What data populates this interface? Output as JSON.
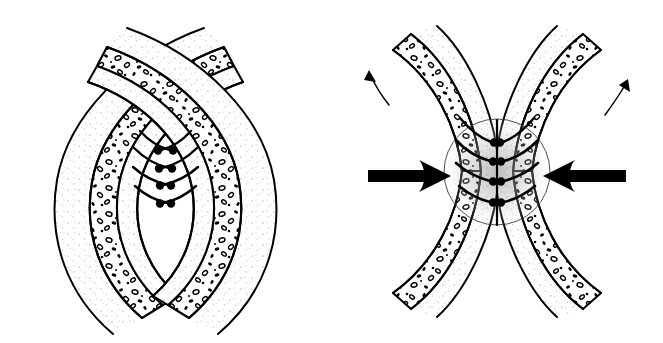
{
  "figure": {
    "background_color": "#ffffff",
    "ink_color": "#000000",
    "width": 663,
    "height": 343,
    "panel_count": 2
  },
  "panels": [
    {
      "id": "A",
      "label": "A",
      "state_description": "unloaded resting configuration, symmetric C-shaped arcs separated by a narrow vertical cleft",
      "label_position": {
        "x": 22,
        "y": 18
      },
      "center_x": 165,
      "center_y": 172,
      "has_compression_arrows": false,
      "has_flow_arrows": false,
      "has_stress_zone": false,
      "layers": [
        {
          "name": "outer-capsule-line",
          "fill": "none",
          "stroke": "#000000",
          "stroke_width": 2.0
        },
        {
          "name": "stippled-matrix-band",
          "fill": "#fbfbfb",
          "stipple": "light",
          "stroke": "#000000",
          "stroke_width": 2.0
        },
        {
          "name": "cellular-band",
          "fill": "#ffffff",
          "stipple": "dense-cells",
          "stroke": "#000000",
          "stroke_width": 2.2
        }
      ],
      "tadpole_structures": {
        "count_per_side": 4,
        "sides": [
          "left",
          "right"
        ],
        "head_color": "#000000",
        "head_radius": 4.2,
        "description": "curved filaments with bulbous terminal heads directed toward the midline cleft"
      }
    },
    {
      "id": "B",
      "label": "B",
      "state_description": "compressed loaded configuration, hourglass constriction with stress concentration at the waist",
      "label_position": {
        "x": 358,
        "y": 18
      },
      "center_x": 497,
      "center_y": 172,
      "has_compression_arrows": true,
      "has_flow_arrows": true,
      "has_stress_zone": true,
      "layers": [
        {
          "name": "outer-capsule-line",
          "fill": "none",
          "stroke": "#000000",
          "stroke_width": 2.0
        },
        {
          "name": "stippled-matrix-band",
          "fill": "#fbfbfb",
          "stipple": "light",
          "stroke": "#000000",
          "stroke_width": 2.0
        },
        {
          "name": "cellular-band",
          "fill": "#ffffff",
          "stipple": "dense-cells",
          "stroke": "#000000",
          "stroke_width": 2.2
        }
      ],
      "tadpole_structures": {
        "count_per_side": 4,
        "sides": [
          "left",
          "right"
        ],
        "head_color": "#000000",
        "head_radius": 4.2,
        "description": "curved filaments compressed together at the constricted midline"
      },
      "stress_zone": {
        "shape": "circle",
        "center_x": 497,
        "center_y": 172,
        "radius": 53,
        "stroke": "#3a3a3a",
        "stroke_width": 0.8,
        "shading": "radial gray stipple gradient, darker toward the centre"
      },
      "compression_arrows": [
        {
          "name": "left-compression-arrow",
          "direction": "right",
          "color": "#000000",
          "tail_x": 368,
          "tip_x": 440,
          "y": 176
        },
        {
          "name": "right-compression-arrow",
          "direction": "left",
          "color": "#000000",
          "tail_x": 657,
          "tip_x": 590,
          "y": 176
        }
      ],
      "flow_arrows": [
        {
          "name": "upper-left-flow-arrow",
          "direction": "up-left",
          "color": "#000000",
          "stroke_width": 1.4
        },
        {
          "name": "upper-right-flow-arrow",
          "direction": "up-right",
          "color": "#000000",
          "stroke_width": 1.4
        }
      ]
    }
  ],
  "colors": {
    "background": "#ffffff",
    "ink": "#000000",
    "stipple_light": "#c9c9c9",
    "stipple_mid": "#9a9a9a",
    "stress_shade": "#b8b8b8",
    "label_text": "#111111"
  }
}
